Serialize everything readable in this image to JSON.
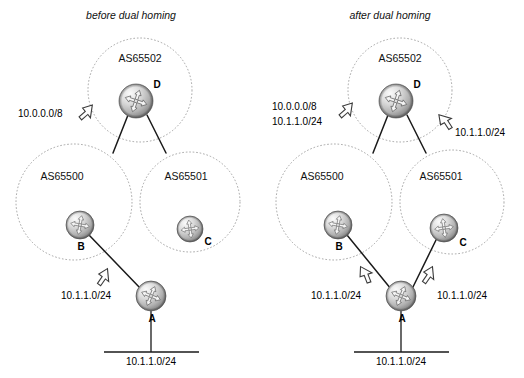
{
  "figure": {
    "title_left": "before dual homing",
    "title_right": "after dual homing"
  },
  "panels": [
    {
      "id": "before",
      "title": "before dual homing",
      "as_domains": [
        {
          "name": "AS65502",
          "cx": 140,
          "cy": 90,
          "r": 52
        },
        {
          "name": "AS65500",
          "cx": 74,
          "cy": 202,
          "r": 58
        },
        {
          "name": "AS65501",
          "cx": 190,
          "cy": 202,
          "r": 50
        }
      ],
      "routers": [
        {
          "id": "D",
          "label": "D",
          "cx": 136,
          "cy": 101,
          "r": 17
        },
        {
          "id": "B",
          "label": "B",
          "cx": 80,
          "cy": 225,
          "r": 14
        },
        {
          "id": "C",
          "label": "C",
          "cx": 190,
          "cy": 230,
          "r": 13
        },
        {
          "id": "A",
          "label": "A",
          "cx": 151,
          "cy": 297,
          "r": 15
        }
      ],
      "links": [
        {
          "from": "D",
          "to": "B-edge",
          "x1": 128,
          "y1": 116,
          "x2": 113,
          "y2": 152
        },
        {
          "from": "D",
          "to": "C-edge",
          "x1": 146,
          "y1": 116,
          "x2": 164,
          "y2": 152
        },
        {
          "from": "B",
          "to": "A",
          "x1": 90,
          "y1": 236,
          "x2": 140,
          "y2": 288
        }
      ],
      "lan": {
        "stem_x": 151,
        "stem_y1": 312,
        "stem_y2": 352,
        "bar_x1": 104,
        "bar_x2": 199,
        "bar_y": 352,
        "label": "10.1.1.0/24",
        "label_x": 151,
        "label_y": 365
      },
      "annotations": [
        {
          "name": "advert-10-0-0-0-8",
          "text": "10.0.0.0/8",
          "text_x": 18,
          "text_y": 117,
          "arrow_x": 85,
          "arrow_y": 112,
          "arrow_rotation": 45
        },
        {
          "name": "advert-10-1-1-0-24-left",
          "text": "10.1.1.0/24",
          "text_x": 62,
          "text_y": 298,
          "arrow_x": 103,
          "arrow_y": 277,
          "arrow_rotation": -28
        }
      ]
    },
    {
      "id": "after",
      "title": "after dual homing",
      "as_domains": [
        {
          "name": "AS65502",
          "cx": 400,
          "cy": 90,
          "r": 52
        },
        {
          "name": "AS65500",
          "cx": 334,
          "cy": 202,
          "r": 58
        },
        {
          "name": "AS65501",
          "cx": 452,
          "cy": 202,
          "r": 52
        }
      ],
      "routers": [
        {
          "id": "D",
          "label": "D",
          "cx": 396,
          "cy": 101,
          "r": 17
        },
        {
          "id": "B",
          "label": "B",
          "cx": 338,
          "cy": 225,
          "r": 14
        },
        {
          "id": "C",
          "label": "C",
          "cx": 444,
          "cy": 228,
          "r": 14
        },
        {
          "id": "A",
          "label": "A",
          "cx": 401,
          "cy": 297,
          "r": 15
        }
      ],
      "links": [
        {
          "from": "D",
          "to": "B-edge",
          "x1": 388,
          "y1": 116,
          "x2": 373,
          "y2": 152
        },
        {
          "from": "D",
          "to": "C-edge",
          "x1": 406,
          "y1": 116,
          "x2": 424,
          "y2": 152
        },
        {
          "from": "B",
          "to": "A",
          "x1": 348,
          "y1": 236,
          "x2": 390,
          "y2": 288
        },
        {
          "from": "C",
          "to": "A",
          "x1": 436,
          "y1": 239,
          "x2": 412,
          "y2": 288
        }
      ],
      "lan": {
        "stem_x": 401,
        "stem_y1": 312,
        "stem_y2": 352,
        "bar_x1": 354,
        "bar_x2": 449,
        "bar_y": 352,
        "label": "10.1.1.0/24",
        "label_x": 401,
        "label_y": 365
      },
      "annotations": [
        {
          "name": "advert-10-0-0-0-8-right",
          "text": "10.0.0.0/8",
          "text_x": 272,
          "text_y": 110,
          "arrow_x": 345,
          "arrow_y": 110,
          "arrow_rotation": 45
        },
        {
          "name": "advert-10-1-1-0-24-to-d-left",
          "text": "10.1.1.0/24",
          "text_x": 272,
          "text_y": 125,
          "arrow_x": null,
          "arrow_y": null,
          "arrow_rotation": null
        },
        {
          "name": "advert-10-1-1-0-24-to-d-right",
          "text": "10.1.1.0/24",
          "text_x": 449,
          "text_y": 134,
          "arrow_x": 443,
          "arrow_y": 120,
          "arrow_rotation": -28
        },
        {
          "name": "advert-10-1-1-0-24-b",
          "text": "10.1.1.0/24",
          "text_x": 312,
          "text_y": 298,
          "arrow_x": 365,
          "arrow_y": 275,
          "arrow_rotation": -28
        },
        {
          "name": "advert-10-1-1-0-24-c",
          "text": "10.1.1.0/24",
          "text_x": 437,
          "text_y": 298,
          "arrow_x": 427,
          "arrow_y": 275,
          "arrow_rotation": 28
        }
      ]
    }
  ],
  "colors": {
    "background": "#ffffff",
    "as_circle_stroke": "#9a9a9a",
    "link": "#1a1a1a",
    "router_body_light": "#f2f2f2",
    "router_body_mid": "#bdbdbd",
    "router_body_dark": "#7d7d7d",
    "arrow_fill": "#fdfdfd",
    "arrow_stroke": "#3a3a3a",
    "text": "#111111"
  }
}
